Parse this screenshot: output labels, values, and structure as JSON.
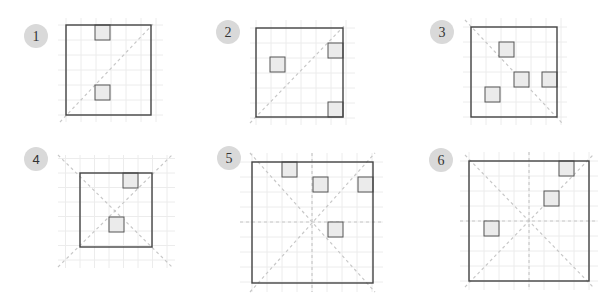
{
  "colors": {
    "grid": "#ececec",
    "dashed": "#c8c8c8",
    "outline": "#444444",
    "cell_fill": "#ebebeb",
    "cell_stroke": "#555555",
    "badge_fill": "#d9d9d9",
    "badge_text": "#333333"
  },
  "panels": [
    {
      "label": "1",
      "badge": {
        "cx": 36,
        "cy": 36,
        "r": 12
      },
      "square": {
        "x": 66,
        "y": 25,
        "w": 85,
        "h": 90
      },
      "grid": {
        "x0": 58,
        "y0": 18,
        "x1": 163,
        "y1": 122,
        "step": 15
      },
      "dashed_lines": [
        [
          60,
          122,
          155,
          22
        ]
      ],
      "cells": [
        [
          95,
          25
        ],
        [
          95,
          85
        ]
      ]
    },
    {
      "label": "2",
      "badge": {
        "cx": 228,
        "cy": 32,
        "r": 12
      },
      "square": {
        "x": 256,
        "y": 28,
        "w": 87,
        "h": 89
      },
      "grid": {
        "x0": 250,
        "y0": 20,
        "x1": 355,
        "y1": 125,
        "step": 15
      },
      "dashed_lines": [
        [
          250,
          123,
          345,
          25
        ]
      ],
      "cells": [
        [
          270,
          57
        ],
        [
          328,
          43
        ],
        [
          328,
          102
        ]
      ]
    },
    {
      "label": "3",
      "badge": {
        "cx": 442,
        "cy": 32,
        "r": 12
      },
      "square": {
        "x": 471,
        "y": 27,
        "w": 86,
        "h": 90
      },
      "grid": {
        "x0": 463,
        "y0": 18,
        "x1": 567,
        "y1": 125,
        "step": 15
      },
      "dashed_lines": [
        [
          465,
          20,
          562,
          123
        ]
      ],
      "cells": [
        [
          499,
          42
        ],
        [
          514,
          72
        ],
        [
          542,
          72
        ],
        [
          485,
          87
        ]
      ]
    },
    {
      "label": "4",
      "sans": true,
      "badge": {
        "cx": 36,
        "cy": 159,
        "r": 12
      },
      "square": {
        "x": 80,
        "y": 173,
        "w": 72,
        "h": 74
      },
      "grid": {
        "x0": 58,
        "y0": 155,
        "x1": 175,
        "y1": 268,
        "step": 14.5
      },
      "dashed_lines": [
        [
          58,
          155,
          172,
          267
        ],
        [
          58,
          267,
          172,
          155
        ]
      ],
      "cells": [
        [
          123,
          173
        ],
        [
          109,
          217
        ]
      ]
    },
    {
      "label": "5",
      "badge": {
        "cx": 229,
        "cy": 158,
        "r": 12
      },
      "square": {
        "x": 252,
        "y": 162,
        "w": 121,
        "h": 121
      },
      "grid": {
        "x0": 240,
        "y0": 153,
        "x1": 383,
        "y1": 292,
        "step": 15
      },
      "dashed_lines": [
        [
          250,
          153,
          375,
          292
        ],
        [
          250,
          292,
          375,
          153
        ],
        [
          240,
          222,
          383,
          222
        ],
        [
          312,
          153,
          312,
          292
        ]
      ],
      "cells": [
        [
          282,
          162
        ],
        [
          313,
          177
        ],
        [
          358,
          177
        ],
        [
          328,
          222
        ]
      ]
    },
    {
      "label": "6",
      "badge": {
        "cx": 441,
        "cy": 160,
        "r": 12
      },
      "square": {
        "x": 469,
        "y": 161,
        "w": 120,
        "h": 120
      },
      "grid": {
        "x0": 460,
        "y0": 152,
        "x1": 598,
        "y1": 290,
        "step": 15
      },
      "dashed_lines": [
        [
          465,
          155,
          593,
          287
        ],
        [
          465,
          287,
          593,
          155
        ],
        [
          460,
          221,
          598,
          221
        ],
        [
          529,
          152,
          529,
          290
        ]
      ],
      "cells": [
        [
          559,
          161
        ],
        [
          544,
          191
        ],
        [
          484,
          221
        ]
      ]
    }
  ],
  "cell_size": 15
}
